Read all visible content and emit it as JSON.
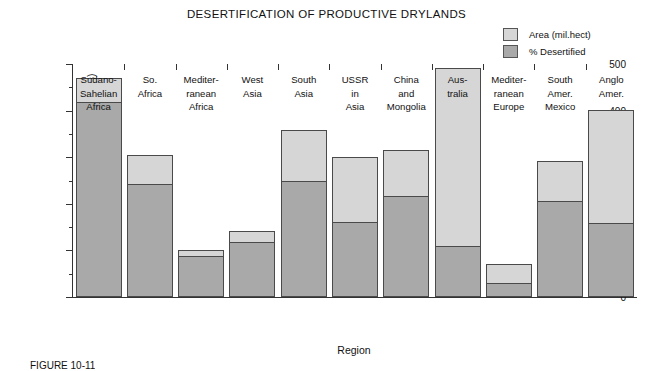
{
  "chart_data": {
    "type": "bar",
    "subtype": "stacked",
    "title": "DESERTIFICATION OF PRODUCTIVE DRYLANDS",
    "xlabel": "Region",
    "ylabel": "Area (million hectares)",
    "ylim": [
      0,
      500
    ],
    "ytick_labels": [
      "0",
      "100",
      "200",
      "300",
      "400",
      "500"
    ],
    "ytick_values": [
      0,
      100,
      200,
      300,
      400,
      500
    ],
    "yminor_interval": 50,
    "grid": false,
    "legend_position": "top-right",
    "categories": [
      "Sudano-Sahelian Africa",
      "So. Africa",
      "Mediterranean Africa",
      "West Asia",
      "South Asia",
      "USSR in Asia",
      "China and Mongolia",
      "Australia",
      "Mediterranean Europe",
      "South Amer. Mexico",
      "Anglo Amer."
    ],
    "category_label_lines": [
      [
        "Sudano-",
        "Sahelian",
        "Africa"
      ],
      [
        "So.",
        "Africa"
      ],
      [
        "Mediter-",
        "ranean",
        "Africa"
      ],
      [
        "West",
        "Asia"
      ],
      [
        "South",
        "Asia"
      ],
      [
        "USSR",
        "in",
        "Asia"
      ],
      [
        "China",
        "and",
        "Mongolia"
      ],
      [
        "Aus-",
        "tralia"
      ],
      [
        "Mediter-",
        "ranean",
        "Europe"
      ],
      [
        "South",
        "Amer.",
        "Mexico"
      ],
      [
        "Anglo",
        "Amer."
      ]
    ],
    "series": [
      {
        "name": "Area (mil.hect)",
        "color": "#d6d6d6",
        "values": [
          470,
          305,
          100,
          142,
          358,
          300,
          315,
          491,
          71,
          292,
          402
        ]
      },
      {
        "name": "% Desertified",
        "color": "#a9a9a9",
        "values": [
          418,
          243,
          88,
          118,
          250,
          162,
          217,
          110,
          30,
          205,
          158
        ]
      }
    ]
  },
  "legend": {
    "items": [
      {
        "label": "Area (mil.hect)",
        "color": "#d6d6d6"
      },
      {
        "label": "% Desertified",
        "color": "#a9a9a9"
      }
    ]
  },
  "figure": {
    "caption": "FIGURE 10-11"
  },
  "colors": {
    "area_fill": "#d6d6d6",
    "desertified_fill": "#a9a9a9",
    "outline": "#4a4a4a",
    "axis": "#333333",
    "background": "#ffffff"
  }
}
